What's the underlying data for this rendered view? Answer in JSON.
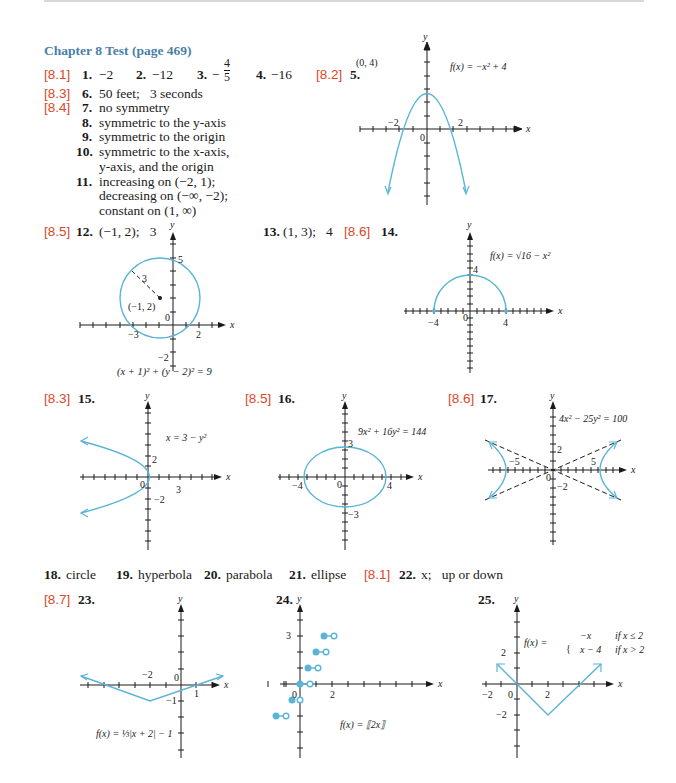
{
  "header": {
    "title": "Chapter 8 Test (page 469)"
  },
  "colors": {
    "title": "#4a7fa8",
    "section": "#d9482b",
    "curve": "#5ab4d6",
    "text": "#1a1a1a"
  },
  "answers": [
    {
      "section": "[8.1]",
      "num": "1.",
      "text": "−2"
    },
    {
      "num": "2.",
      "text": "−12"
    },
    {
      "num": "3.",
      "text": "−",
      "frac_num": "4",
      "frac_den": "5"
    },
    {
      "num": "4.",
      "text": "−16"
    },
    {
      "section": "[8.2]",
      "num": "5.",
      "text": ""
    },
    {
      "section": "[8.3]",
      "num": "6.",
      "text": "50 feet;   3 seconds"
    },
    {
      "section": "[8.4]",
      "num": "7.",
      "text": "no symmetry"
    },
    {
      "num": "8.",
      "text": "symmetric to the y-axis"
    },
    {
      "num": "9.",
      "text": "symmetric to the origin"
    },
    {
      "num": "10.",
      "lines": [
        "symmetric to the x-axis,",
        "y-axis, and the origin"
      ]
    },
    {
      "num": "11.",
      "lines": [
        "increasing on (−2, 1);",
        "decreasing on (−∞, −2);",
        "constant on (1, ∞)"
      ]
    },
    {
      "section": "[8.5]",
      "num": "12.",
      "text": "(−1, 2);   3"
    },
    {
      "num": "13.",
      "text": "(1, 3);   4"
    },
    {
      "section": "[8.6]",
      "num": "14.",
      "text": ""
    },
    {
      "section": "[8.3]",
      "num": "15.",
      "text": ""
    },
    {
      "section": "[8.5]",
      "num": "16.",
      "text": ""
    },
    {
      "section": "[8.6]",
      "num": "17.",
      "text": ""
    },
    {
      "num": "18.",
      "text": "circle"
    },
    {
      "num": "19.",
      "text": "hyperbola"
    },
    {
      "num": "20.",
      "text": "parabola"
    },
    {
      "num": "21.",
      "text": "ellipse"
    },
    {
      "section": "[8.1]",
      "num": "22.",
      "text": "x;   up or down"
    },
    {
      "section": "[8.7]",
      "num": "23.",
      "text": ""
    },
    {
      "num": "24.",
      "text": ""
    },
    {
      "num": "25.",
      "text": ""
    }
  ],
  "graphs": {
    "g5": {
      "equation": "f(x) = −x² + 4",
      "vertex_label": "(0, 4)",
      "x_labels": [
        "−2",
        "0",
        "2"
      ],
      "axis_x": "x",
      "axis_y": "y"
    },
    "g12": {
      "equation": "(x + 1)² + (y − 2)² = 9",
      "center_label": "(−1, 2)",
      "radius_label": "3",
      "x_labels": [
        "−3",
        "0",
        "2"
      ],
      "y_labels": [
        "5",
        "−2"
      ],
      "axis_x": "x",
      "axis_y": "y"
    },
    "g14": {
      "equation": "f(x) = √16 − x²",
      "x_labels": [
        "−4",
        "0",
        "4"
      ],
      "y_labels": [
        "4"
      ],
      "axis_x": "x",
      "axis_y": "y"
    },
    "g15": {
      "equation": "x = 3 − y²",
      "x_labels": [
        "0",
        "3"
      ],
      "y_labels": [
        "2",
        "−2"
      ],
      "axis_x": "x",
      "axis_y": "y"
    },
    "g16": {
      "equation": "9x² + 16y² = 144",
      "x_labels": [
        "−4",
        "0",
        "4"
      ],
      "y_labels": [
        "3",
        "−3"
      ],
      "axis_x": "x",
      "axis_y": "y"
    },
    "g17": {
      "equation": "4x² − 25y² = 100",
      "x_labels": [
        "−5",
        "0",
        "5"
      ],
      "y_labels": [
        "2",
        "−2"
      ],
      "axis_x": "x",
      "axis_y": "y"
    },
    "g23": {
      "equation": "f(x) = ⅓|x + 2| − 1",
      "x_labels": [
        "−2",
        "0",
        "1"
      ],
      "y_labels": [
        "−1"
      ],
      "axis_x": "x",
      "axis_y": "y"
    },
    "g24": {
      "equation": "f(x) = ⟦2x⟧",
      "x_labels": [
        "0",
        "2"
      ],
      "y_labels": [
        "3"
      ],
      "axis_x": "x",
      "axis_y": "y"
    },
    "g25": {
      "eq_prefix": "f(x) =",
      "case1": "−x",
      "cond1": "if x ≤ 2",
      "case2": "x − 4",
      "cond2": "if x > 2",
      "x_labels": [
        "−2",
        "0",
        "2"
      ],
      "y_labels": [
        "2",
        "−2"
      ],
      "axis_x": "x",
      "axis_y": "y"
    }
  }
}
